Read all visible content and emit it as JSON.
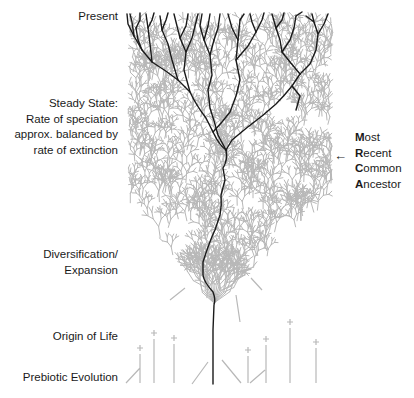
{
  "diagram": {
    "timeline_labels": [
      {
        "id": "present",
        "lines": [
          "Present"
        ]
      },
      {
        "id": "steady-state",
        "lines": [
          "Steady State:",
          "Rate of speciation",
          "approx. balanced by",
          "rate of extinction"
        ]
      },
      {
        "id": "diversification",
        "lines": [
          "Diversification/",
          "Expansion"
        ]
      },
      {
        "id": "origin-of-life",
        "lines": [
          "Origin of Life"
        ]
      },
      {
        "id": "prebiotic-evolution",
        "lines": [
          "Prebiotic Evolution"
        ]
      }
    ],
    "mrca_label": {
      "lines": [
        {
          "initial": "M",
          "rest": "ost"
        },
        {
          "initial": "R",
          "rest": "ecent"
        },
        {
          "initial": "C",
          "rest": "ommon"
        },
        {
          "initial": "A",
          "rest": "ncestor"
        }
      ],
      "arrow": "←"
    },
    "colors": {
      "extinct_lineages": "#b8b8b8",
      "surviving_lineages": "#1a1a1a",
      "text": "#1a1a1a",
      "background": "#ffffff"
    }
  }
}
